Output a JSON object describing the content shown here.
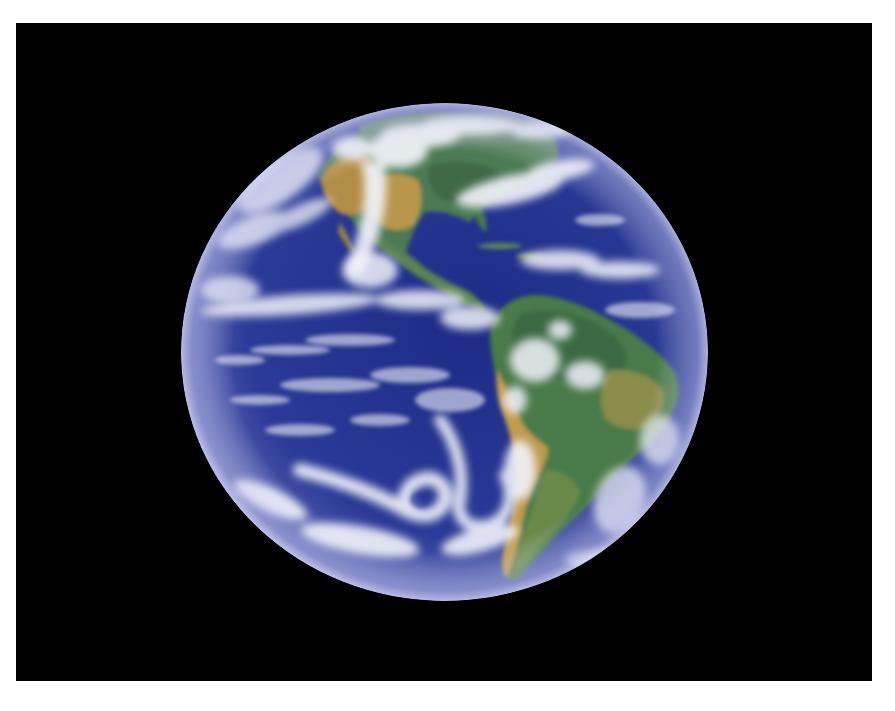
{
  "image": {
    "subject": "Earth viewed from space — Western Hemisphere (North & South America)",
    "background_color": "#000000",
    "border_color": "#ffffff",
    "frame": {
      "x": 16,
      "y": 23,
      "width": 856,
      "height": 658
    },
    "globe": {
      "cx": 444.5,
      "cy": 352,
      "rx": 263.5,
      "ry": 249
    },
    "colors": {
      "ocean_deep": "#1a2a7a",
      "ocean": "#2b3c94",
      "limb_haze": "#8a8ccc",
      "cloud": "#f2f3fa",
      "land_green": "#4f7a48",
      "land_tan": "#b8944a",
      "forest": "#3f6a45"
    },
    "regions": [
      {
        "name": "North America",
        "approx_bbox": [
          320,
          140,
          520,
          250
        ]
      },
      {
        "name": "Gulf of Mexico",
        "approx_bbox": [
          410,
          205,
          470,
          250
        ]
      },
      {
        "name": "Central America",
        "approx_bbox": [
          400,
          240,
          480,
          300
        ]
      },
      {
        "name": "South America",
        "approx_bbox": [
          490,
          295,
          680,
          585
        ]
      },
      {
        "name": "Pacific cyclone",
        "approx_bbox": [
          380,
          475,
          470,
          545
        ]
      }
    ]
  }
}
